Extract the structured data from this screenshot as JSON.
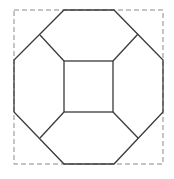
{
  "diagram": {
    "type": "geometric-figure",
    "colors": {
      "background": "#ffffff",
      "stroke": "#3a3a3a",
      "dashed": "#8a8a8a"
    },
    "bounding_square": {
      "x": 14,
      "y": 10,
      "width": 149,
      "height": 154
    },
    "octagon_points": [
      [
        64,
        10
      ],
      [
        114,
        10
      ],
      [
        163,
        60
      ],
      [
        163,
        112
      ],
      [
        114,
        164
      ],
      [
        64,
        164
      ],
      [
        14,
        112
      ],
      [
        14,
        60
      ]
    ],
    "inner_square": {
      "x": 64,
      "y": 61,
      "width": 49,
      "height": 51
    },
    "junctions": [
      [
        40,
        35
      ],
      [
        138,
        34
      ],
      [
        40,
        138
      ],
      [
        138,
        138
      ]
    ]
  }
}
